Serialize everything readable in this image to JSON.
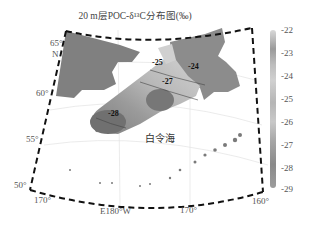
{
  "title": "20 m层POC-δ¹³C分布图(‰)",
  "map": {
    "region_label": "白令海",
    "lat_labels": [
      {
        "text": "65°",
        "sub": "N"
      },
      {
        "text": "60°"
      },
      {
        "text": "55°"
      },
      {
        "text": "50°"
      }
    ],
    "lon_labels": [
      {
        "text": "170°"
      },
      {
        "text": "E180°W"
      },
      {
        "text": "170°"
      },
      {
        "text": "160°"
      }
    ],
    "contour_labels": [
      "-25",
      "-24",
      "-27",
      "-28",
      "-28"
    ]
  },
  "colorbar": {
    "ticks": [
      "-22",
      "-23",
      "-24",
      "-25",
      "-26",
      "-27",
      "-28",
      "-29"
    ],
    "min": -29,
    "max": -22
  },
  "colors": {
    "land": "#808080",
    "ocean": "#ffffff",
    "frame": "#111111"
  }
}
